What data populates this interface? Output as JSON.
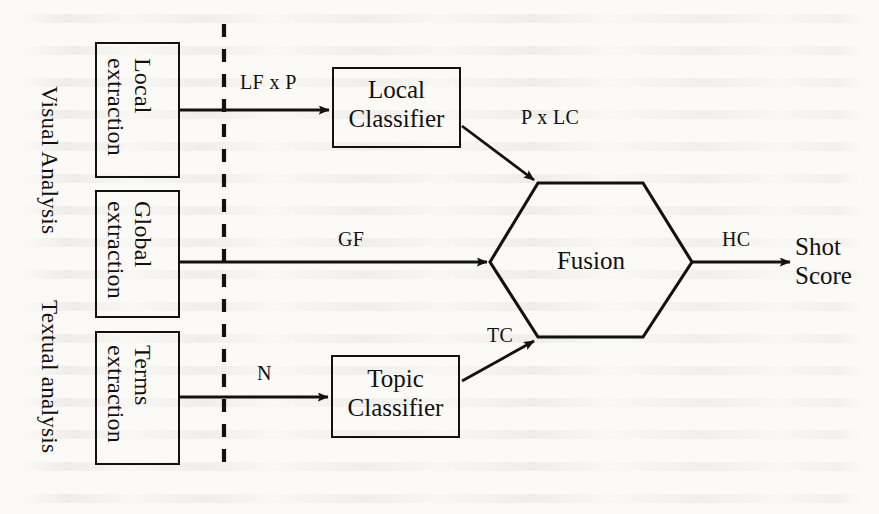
{
  "diagram": {
    "title": "Visual and Textual Analysis Fusion Architecture",
    "section_labels": [
      {
        "id": "visual",
        "text": "Visual Analysis"
      },
      {
        "id": "textual",
        "text": "Textual analysis"
      }
    ],
    "extraction_nodes": [
      {
        "id": "local-extraction",
        "line1": "Local",
        "line2": "extraction"
      },
      {
        "id": "global-extraction",
        "line1": "Global",
        "line2": "extraction"
      },
      {
        "id": "terms-extraction",
        "line1": "Terms",
        "line2": "extraction"
      }
    ],
    "classifier_nodes": [
      {
        "id": "local-classifier",
        "line1": "Local",
        "line2": "Classifier"
      },
      {
        "id": "topic-classifier",
        "line1": "Topic",
        "line2": "Classifier"
      }
    ],
    "fusion_node": {
      "id": "fusion",
      "label": "Fusion"
    },
    "output_node": {
      "id": "shot-score",
      "line1": "Shot",
      "line2": "Score"
    },
    "edge_labels": [
      {
        "id": "lf-x-p",
        "text": "LF x P"
      },
      {
        "id": "gf",
        "text": "GF"
      },
      {
        "id": "n",
        "text": "N"
      },
      {
        "id": "p-x-lc",
        "text": "P x LC"
      },
      {
        "id": "tc",
        "text": "TC"
      },
      {
        "id": "hc",
        "text": "HC"
      }
    ],
    "divider": {
      "id": "stage-divider",
      "style": "dashed-vertical"
    },
    "colors": {
      "stroke": "#121212",
      "background": "#fbfaf7",
      "text": "#111111"
    }
  }
}
